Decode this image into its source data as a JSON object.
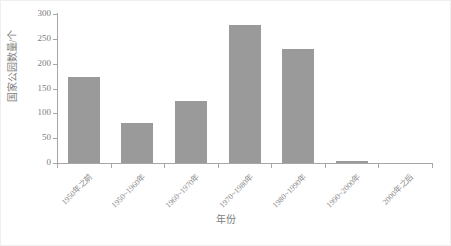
{
  "chart_data": {
    "type": "bar",
    "title": "",
    "subtitle": "",
    "xlabel": "年份",
    "ylabel": "国家公园数量/个",
    "categories": [
      "1950年之前",
      "1950~1960年",
      "1960~1970年",
      "1970~1980年",
      "1980~1990年",
      "1990~2000年",
      "2000年之后"
    ],
    "values": [
      173,
      80,
      125,
      277,
      229,
      5,
      0
    ],
    "series": [
      {
        "name": "国家公园数量",
        "values": [
          173,
          80,
          125,
          277,
          229,
          5,
          0
        ]
      }
    ],
    "ylim": [
      0,
      300
    ],
    "yticks": [
      0,
      50,
      100,
      150,
      200,
      250,
      300
    ],
    "ytick_labels": [
      "0",
      "50",
      "100",
      "150",
      "200",
      "250",
      "300"
    ],
    "grid": false,
    "legend": "none",
    "bar_color": "#9a9a9a",
    "axis_color": "#a6a6a6",
    "text_color": "#7d7d7d",
    "background": "#ffffff",
    "xtick_label_rotation": -45
  }
}
